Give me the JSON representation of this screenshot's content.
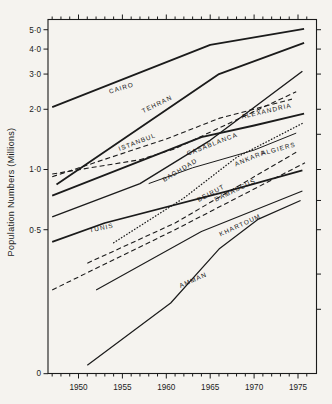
{
  "figure_caption": "",
  "chart_data": {
    "type": "line",
    "title": "",
    "xlabel": "",
    "ylabel": "Population Numbers (Millions)",
    "y_scale": "log",
    "x_range": [
      1946.5,
      1977.1
    ],
    "y_axis_ticks": [
      {
        "value": 5.0,
        "label": "5·0"
      },
      {
        "value": 4.0,
        "label": "4·0"
      },
      {
        "value": 3.0,
        "label": "3·0"
      },
      {
        "value": 2.0,
        "label": "2·0"
      },
      {
        "value": 1.0,
        "label": "1·0"
      },
      {
        "value": 0.5,
        "label": "0·5"
      },
      {
        "value": 0.0953,
        "label": "0"
      }
    ],
    "right_axis_tick_values": [
      5.0,
      4.0,
      3.0,
      2.0,
      1.5,
      1.0,
      0.7,
      0.5,
      0.3,
      0.2
    ],
    "x_ticks_labeled": [
      {
        "year": 1950,
        "label": "1950"
      },
      {
        "year": 1955,
        "label": "1955"
      },
      {
        "year": 1960,
        "label": "1960"
      },
      {
        "year": 1965,
        "label": "1965"
      },
      {
        "year": 1970,
        "label": "1970"
      },
      {
        "year": 1975,
        "label": "1975"
      }
    ],
    "x_minor_tick_years": [
      1947,
      1948,
      1949,
      1950,
      1951,
      1952,
      1953,
      1954,
      1955,
      1956,
      1957,
      1958,
      1959,
      1960,
      1961,
      1962,
      1963,
      1964,
      1965,
      1966,
      1967,
      1968,
      1969,
      1970,
      1971,
      1972,
      1973,
      1974,
      1975,
      1976
    ],
    "grid": "off",
    "legend": "labels-along-lines",
    "series": [
      {
        "name": "CAIRO",
        "style": "solid",
        "width": 1.8,
        "points": [
          [
            1947,
            2.05
          ],
          [
            1965,
            4.2
          ],
          [
            1975.7,
            5.05
          ]
        ],
        "label": {
          "x": 122,
          "y": 90,
          "angle": -17
        }
      },
      {
        "name": "TEHRAN",
        "style": "solid",
        "width": 1.8,
        "points": [
          [
            1947.5,
            0.84
          ],
          [
            1966,
            3.0
          ],
          [
            1975.7,
            4.3
          ]
        ],
        "label": {
          "x": 158,
          "y": 106,
          "angle": -26
        }
      },
      {
        "name": "ISTANBUL",
        "style": "dashed",
        "width": 1.1,
        "points": [
          [
            1947,
            0.95
          ],
          [
            1957,
            1.12
          ],
          [
            1961,
            1.27
          ],
          [
            1974.8,
            2.45
          ]
        ],
        "label": {
          "x": 138,
          "y": 144,
          "angle": -21
        }
      },
      {
        "name": "ALEXANDRIA",
        "style": "dashed",
        "width": 1.1,
        "points": [
          [
            1947,
            0.92
          ],
          [
            1960,
            1.42
          ],
          [
            1966,
            1.8
          ],
          [
            1974.3,
            2.25
          ]
        ],
        "label": {
          "x": 267,
          "y": 113,
          "angle": -13
        }
      },
      {
        "name": "BAGHDAD",
        "style": "solid",
        "width": 1.4,
        "points": [
          [
            1947,
            0.58
          ],
          [
            1957,
            0.85
          ],
          [
            1965,
            1.4
          ],
          [
            1975.5,
            3.1
          ]
        ],
        "label": {
          "x": 181,
          "y": 172,
          "angle": -31
        }
      },
      {
        "name": "CASABLANCA",
        "style": "solid",
        "width": 1.8,
        "points": [
          [
            1947,
            0.74
          ],
          [
            1964,
            1.45
          ],
          [
            1970,
            1.66
          ],
          [
            1975.7,
            1.9
          ]
        ],
        "label": {
          "x": 213,
          "y": 146,
          "angle": -21
        }
      },
      {
        "name": "ANKARA",
        "style": "dotted",
        "width": 1.3,
        "points": [
          [
            1954,
            0.43
          ],
          [
            1962,
            0.72
          ],
          [
            1968,
            1.15
          ],
          [
            1975.5,
            1.7
          ]
        ],
        "label": {
          "x": 251,
          "y": 160,
          "angle": -23
        }
      },
      {
        "name": "ALGIERS",
        "style": "solid",
        "width": 1.0,
        "points": [
          [
            1958,
            0.85
          ],
          [
            1963,
            1.02
          ],
          [
            1970,
            1.25
          ],
          [
            1974.8,
            1.52
          ]
        ],
        "label": {
          "x": 279,
          "y": 151,
          "angle": -15
        }
      },
      {
        "name": "TUNIS",
        "style": "solid",
        "width": 1.8,
        "points": [
          [
            1947,
            0.435
          ],
          [
            1953,
            0.54
          ],
          [
            1967,
            0.78
          ],
          [
            1975.5,
            0.99
          ]
        ],
        "label": {
          "x": 102,
          "y": 230,
          "angle": -12
        }
      },
      {
        "name": "BEIRUT",
        "style": "dashed",
        "width": 1.1,
        "points": [
          [
            1951,
            0.34
          ],
          [
            1961,
            0.54
          ],
          [
            1974.8,
            1.22
          ]
        ],
        "label": {
          "x": 212,
          "y": 195,
          "angle": -28
        }
      },
      {
        "name": "DAMASCUS",
        "style": "dashed",
        "width": 1.1,
        "points": [
          [
            1947,
            0.25
          ],
          [
            1961,
            0.5
          ],
          [
            1975.8,
            1.08
          ]
        ],
        "label": {
          "x": 236,
          "y": 192,
          "angle": -26
        }
      },
      {
        "name": "KHARTOUM",
        "style": "solid",
        "width": 1.1,
        "points": [
          [
            1952,
            0.25
          ],
          [
            1964,
            0.49
          ],
          [
            1975.5,
            0.78
          ]
        ],
        "label": {
          "x": 241,
          "y": 227,
          "angle": -25
        }
      },
      {
        "name": "AMMAN",
        "style": "solid",
        "width": 1.2,
        "points": [
          [
            1951,
            0.105
          ],
          [
            1960.5,
            0.215
          ],
          [
            1966,
            0.4
          ],
          [
            1970.5,
            0.565
          ],
          [
            1975.3,
            0.7
          ]
        ],
        "label": {
          "x": 194,
          "y": 282,
          "angle": -24
        }
      }
    ],
    "colors": {
      "ink": "#1b1b1b",
      "paper": "#f5f3ef"
    }
  }
}
